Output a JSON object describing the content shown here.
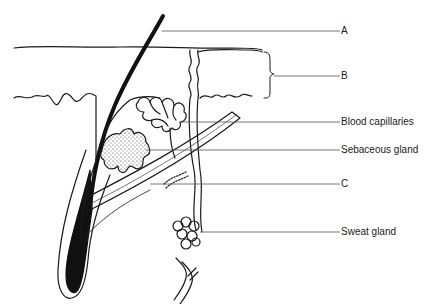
{
  "diagram": {
    "colors": {
      "line": "#1a1a1a",
      "leader": "#555555",
      "hair": "#111111",
      "background": "#ffffff"
    },
    "labels": [
      {
        "id": "A",
        "text": "A",
        "x": 341,
        "y": 26
      },
      {
        "id": "B",
        "text": "B",
        "x": 341,
        "y": 72
      },
      {
        "id": "blood-capillaries",
        "text": "Blood capillaries",
        "x": 341,
        "y": 118
      },
      {
        "id": "sebaceous-gland",
        "text": "Sebaceous gland",
        "x": 341,
        "y": 145
      },
      {
        "id": "C",
        "text": "C",
        "x": 341,
        "y": 180
      },
      {
        "id": "sweat-gland",
        "text": "Sweat gland",
        "x": 341,
        "y": 225
      }
    ]
  }
}
